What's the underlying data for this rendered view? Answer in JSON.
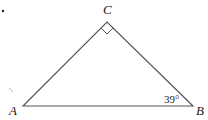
{
  "figure": {
    "type": "right-triangle",
    "vertices": {
      "A": {
        "label": "A",
        "x": 23,
        "y": 106
      },
      "B": {
        "label": "B",
        "x": 193,
        "y": 106
      },
      "C": {
        "label": "C",
        "x": 107,
        "y": 22
      }
    },
    "right_angle_at": "C",
    "angle_B_label": "39°",
    "bullet": "•",
    "stroke_color": "#555555"
  }
}
